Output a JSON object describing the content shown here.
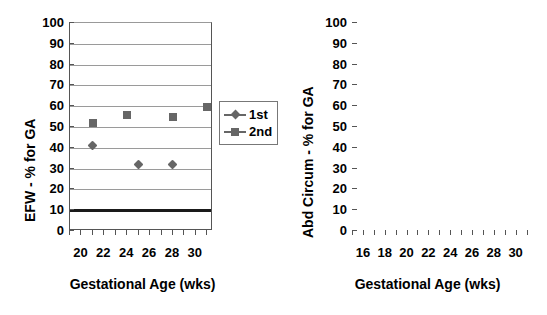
{
  "figure": {
    "background": "#ffffff",
    "marker_color": "#666666",
    "gridline_color": "#9a9a9a",
    "axis_color": "#555555",
    "reference_line_color": "#1a1a1a"
  },
  "legend": {
    "position": "between-panels-right-of-left-chart",
    "entries": [
      {
        "label": "1st",
        "marker": "diamond"
      },
      {
        "label": "2nd",
        "marker": "square"
      }
    ]
  },
  "chart_data": [
    {
      "type": "scatter",
      "title": "",
      "panel": "left",
      "ylabel": "EFW - % for GA",
      "xlabel": "Gestational Age (wks)",
      "ylim": [
        0,
        100
      ],
      "ytick_labels": [
        "0",
        "10",
        "20",
        "30",
        "40",
        "50",
        "60",
        "70",
        "80",
        "90",
        "100"
      ],
      "ytick_values": [
        0,
        10,
        20,
        30,
        40,
        50,
        60,
        70,
        80,
        90,
        100
      ],
      "xlim": [
        19,
        31.5
      ],
      "xtick_values": [
        19,
        20,
        21,
        22,
        23,
        24,
        25,
        26,
        27,
        28,
        29,
        30,
        31
      ],
      "xtick_labels": [
        "20",
        "22",
        "24",
        "26",
        "28",
        "30"
      ],
      "xtick_label_values": [
        20,
        22,
        24,
        26,
        28,
        30
      ],
      "grid": true,
      "reference_line": {
        "value": 10,
        "style": "thick-solid"
      },
      "series": [
        {
          "name": "1st",
          "marker": "diamond",
          "x": [
            21,
            25,
            28
          ],
          "values": [
            41,
            32,
            32
          ]
        },
        {
          "name": "2nd",
          "marker": "square",
          "x": [
            21,
            24,
            28,
            31
          ],
          "values": [
            52,
            56,
            55,
            59.5
          ]
        }
      ]
    },
    {
      "type": "scatter",
      "title": "",
      "panel": "right",
      "ylabel": "Abd Circum - % for GA",
      "xlabel": "Gestational Age (wks)",
      "ylim": [
        0,
        100
      ],
      "ytick_labels": [
        "0",
        "10",
        "20",
        "30",
        "40",
        "50",
        "60",
        "70",
        "80",
        "90",
        "100"
      ],
      "ytick_values": [
        0,
        10,
        20,
        30,
        40,
        50,
        60,
        70,
        80,
        90,
        100
      ],
      "xlim": [
        15,
        31.5
      ],
      "xtick_values": [
        15,
        16,
        17,
        18,
        19,
        20,
        21,
        22,
        23,
        24,
        25,
        26,
        27,
        28,
        29,
        30,
        31
      ],
      "xtick_labels": [
        "16",
        "18",
        "20",
        "22",
        "24",
        "26",
        "28",
        "30"
      ],
      "xtick_label_values": [
        16,
        18,
        20,
        22,
        24,
        26,
        28,
        30
      ],
      "grid": true,
      "reference_line": {
        "value": 10,
        "style": "thick-solid"
      },
      "series": [
        {
          "name": "1st",
          "marker": "diamond",
          "x": [
            16,
            18,
            21,
            25,
            28
          ],
          "values": [
            56,
            35,
            44.5,
            17,
            15
          ]
        },
        {
          "name": "2nd",
          "marker": "square",
          "x": [
            18,
            21,
            24,
            28,
            31
          ],
          "values": [
            52,
            67,
            63,
            62,
            63
          ]
        }
      ]
    }
  ]
}
